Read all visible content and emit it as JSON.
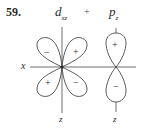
{
  "problem_number": "59.",
  "title": {
    "left_orbital": "d",
    "left_orbital_subscript": "xz",
    "operator": "+",
    "right_orbital": "p",
    "right_orbital_subscript": "z"
  },
  "axes": {
    "x_label": "x",
    "z_label_left": "z",
    "z_label_right": "z"
  },
  "d_xz_lobes": {
    "upper_left": "−",
    "upper_right": "+",
    "lower_left": "+",
    "lower_right": "−"
  },
  "p_z_lobes": {
    "upper": "+",
    "lower": "−"
  },
  "colors": {
    "line": "#4a4a4a",
    "text": "#2a2a2a"
  }
}
